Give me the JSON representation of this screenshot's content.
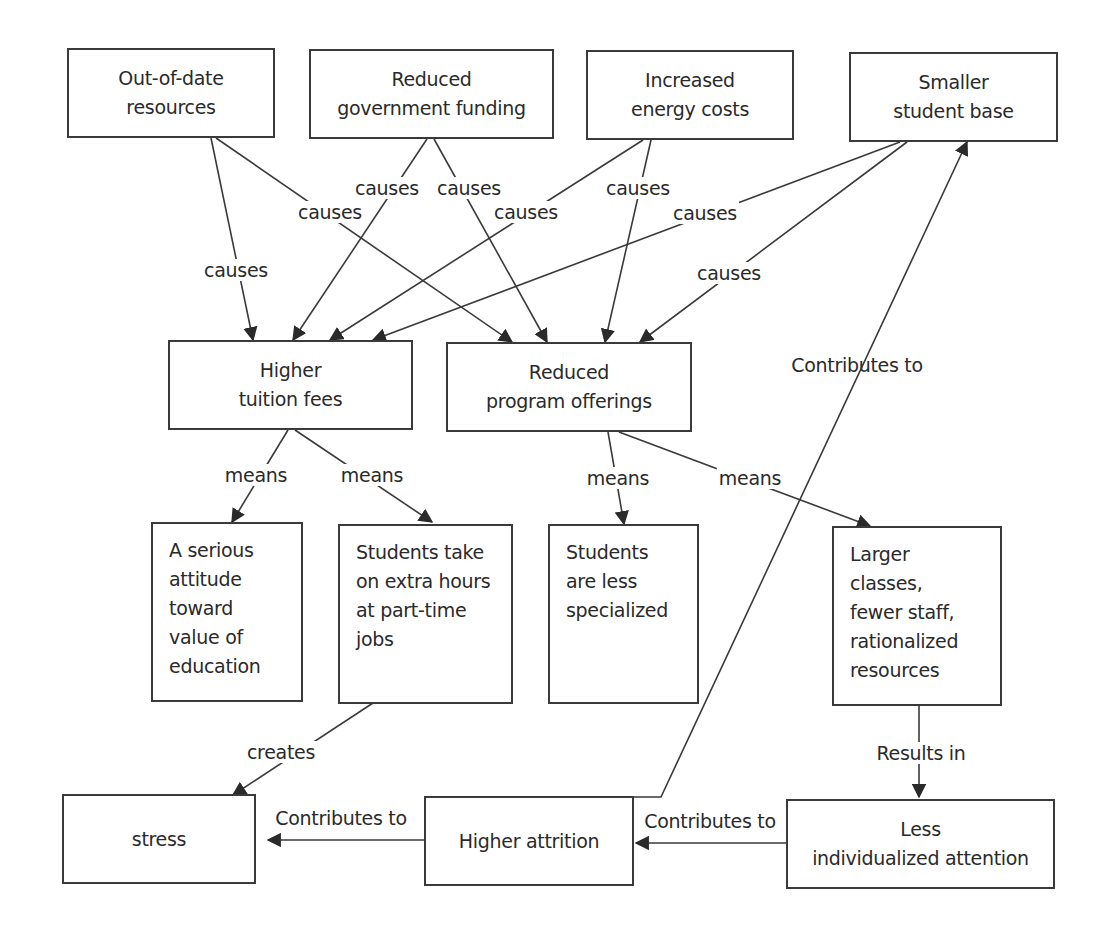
{
  "diagram": {
    "type": "concept-map",
    "line_color": "#3a3a3a",
    "background": "#ffffff",
    "nodes": {
      "out_of_date": {
        "label": "Out-of-date\nresources"
      },
      "gov_funding": {
        "label": "Reduced\ngovernment funding"
      },
      "energy": {
        "label": "Increased\nenergy costs"
      },
      "student_base": {
        "label": "Smaller\nstudent base"
      },
      "tuition": {
        "label": "Higher\ntuition fees"
      },
      "program": {
        "label": "Reduced\nprogram offerings"
      },
      "serious": {
        "label": "A serious\nattitude\ntoward\nvalue of\neducation"
      },
      "part_time": {
        "label": "Students take\non extra hours\nat part-time\njobs"
      },
      "less_specialized": {
        "label": "Students\nare less\nspecialized"
      },
      "larger_classes": {
        "label": "Larger classes,\nfewer staff,\nrationalized\nresources"
      },
      "stress": {
        "label": "stress"
      },
      "attrition": {
        "label": "Higher attrition"
      },
      "less_attention": {
        "label": "Less\nindividualized attention"
      }
    },
    "edges": [
      {
        "from": "out_of_date",
        "to": "tuition",
        "label": "causes"
      },
      {
        "from": "out_of_date",
        "to": "program",
        "label": "causes"
      },
      {
        "from": "gov_funding",
        "to": "tuition",
        "label": "causes"
      },
      {
        "from": "gov_funding",
        "to": "program",
        "label": "causes"
      },
      {
        "from": "energy",
        "to": "tuition",
        "label": "causes"
      },
      {
        "from": "energy",
        "to": "program",
        "label": "causes"
      },
      {
        "from": "student_base",
        "to": "tuition",
        "label": "causes"
      },
      {
        "from": "student_base",
        "to": "program",
        "label": "causes"
      },
      {
        "from": "tuition",
        "to": "serious",
        "label": "means"
      },
      {
        "from": "tuition",
        "to": "part_time",
        "label": "means"
      },
      {
        "from": "program",
        "to": "less_specialized",
        "label": "means"
      },
      {
        "from": "program",
        "to": "larger_classes",
        "label": "means"
      },
      {
        "from": "part_time",
        "to": "stress",
        "label": "creates"
      },
      {
        "from": "larger_classes",
        "to": "less_attention",
        "label": "Results in"
      },
      {
        "from": "less_attention",
        "to": "attrition",
        "label": "Contributes to"
      },
      {
        "from": "attrition",
        "to": "stress",
        "label": "Contributes to"
      },
      {
        "from": "attrition",
        "to": "student_base",
        "label": "Contributes to"
      }
    ]
  }
}
